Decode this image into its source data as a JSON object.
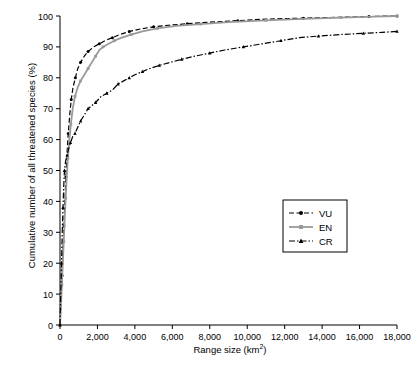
{
  "chart_data": {
    "type": "line",
    "title": "",
    "xlabel": "Range size (km2)",
    "ylabel": "Cumulative number of all threatened species (%)",
    "xlim": [
      0,
      18000
    ],
    "ylim": [
      0,
      100
    ],
    "grid": false,
    "legend_position": "bottom-right",
    "xticks": [
      0,
      2000,
      4000,
      6000,
      8000,
      10000,
      12000,
      14000,
      16000,
      18000
    ],
    "xticklabels": [
      "0",
      "2,000",
      "4,000",
      "6,000",
      "8,000",
      "10,000",
      "12,000",
      "14,000",
      "16,000",
      "18,000"
    ],
    "yticks": [
      0,
      10,
      20,
      30,
      40,
      50,
      60,
      70,
      80,
      90,
      100
    ],
    "yticklabels": [
      "0",
      "10",
      "20",
      "30",
      "40",
      "50",
      "60",
      "70",
      "80",
      "90",
      "100"
    ],
    "series": [
      {
        "name": "VU",
        "color": "#000000",
        "marker": "circle",
        "linestyle": "dashed",
        "points": [
          [
            0,
            0
          ],
          [
            60,
            8
          ],
          [
            110,
            16
          ],
          [
            160,
            24
          ],
          [
            210,
            32
          ],
          [
            260,
            40
          ],
          [
            320,
            48
          ],
          [
            380,
            56
          ],
          [
            440,
            62
          ],
          [
            520,
            68
          ],
          [
            600,
            73
          ],
          [
            700,
            77
          ],
          [
            820,
            80
          ],
          [
            950,
            83
          ],
          [
            1100,
            85
          ],
          [
            1300,
            87
          ],
          [
            1500,
            88.5
          ],
          [
            1800,
            90
          ],
          [
            2100,
            91
          ],
          [
            2400,
            92
          ],
          [
            2800,
            93
          ],
          [
            3200,
            94
          ],
          [
            3700,
            95
          ],
          [
            4300,
            95.8
          ],
          [
            5000,
            96.5
          ],
          [
            5800,
            97
          ],
          [
            6800,
            97.5
          ],
          [
            8000,
            98
          ],
          [
            9500,
            98.5
          ],
          [
            11000,
            99
          ],
          [
            13000,
            99.3
          ],
          [
            15000,
            99.6
          ],
          [
            16500,
            99.8
          ],
          [
            17500,
            100
          ],
          [
            18000,
            100
          ]
        ]
      },
      {
        "name": "EN",
        "color": "#999999",
        "marker": "square",
        "linestyle": "solid",
        "points": [
          [
            0,
            0
          ],
          [
            50,
            6
          ],
          [
            100,
            13
          ],
          [
            150,
            20
          ],
          [
            200,
            27
          ],
          [
            250,
            34
          ],
          [
            300,
            41
          ],
          [
            360,
            48
          ],
          [
            420,
            54
          ],
          [
            500,
            60
          ],
          [
            580,
            65
          ],
          [
            680,
            70
          ],
          [
            800,
            74
          ],
          [
            950,
            77
          ],
          [
            1100,
            79
          ],
          [
            1300,
            81
          ],
          [
            1500,
            83
          ],
          [
            1700,
            85
          ],
          [
            1900,
            87
          ],
          [
            2100,
            89
          ],
          [
            2300,
            90
          ],
          [
            2600,
            91
          ],
          [
            2900,
            92
          ],
          [
            3300,
            93
          ],
          [
            3800,
            94
          ],
          [
            4400,
            95
          ],
          [
            5200,
            96
          ],
          [
            6200,
            96.8
          ],
          [
            7500,
            97.4
          ],
          [
            9000,
            98
          ],
          [
            11000,
            98.6
          ],
          [
            13000,
            99.1
          ],
          [
            15000,
            99.5
          ],
          [
            16800,
            99.8
          ],
          [
            18000,
            100
          ]
        ]
      },
      {
        "name": "CR",
        "color": "#000000",
        "marker": "triangle",
        "linestyle": "dash-dot",
        "points": [
          [
            0,
            0
          ],
          [
            40,
            10
          ],
          [
            80,
            20
          ],
          [
            120,
            30
          ],
          [
            160,
            38
          ],
          [
            200,
            45
          ],
          [
            240,
            50
          ],
          [
            300,
            53
          ],
          [
            380,
            55
          ],
          [
            460,
            57
          ],
          [
            560,
            59
          ],
          [
            680,
            61
          ],
          [
            800,
            62
          ],
          [
            950,
            64
          ],
          [
            1100,
            66
          ],
          [
            1300,
            68
          ],
          [
            1500,
            70
          ],
          [
            1700,
            71
          ],
          [
            1900,
            72
          ],
          [
            2200,
            74
          ],
          [
            2500,
            75
          ],
          [
            2800,
            76
          ],
          [
            3100,
            78
          ],
          [
            3400,
            79
          ],
          [
            3700,
            80
          ],
          [
            4000,
            81
          ],
          [
            4400,
            82
          ],
          [
            4800,
            83
          ],
          [
            5300,
            84
          ],
          [
            5900,
            85
          ],
          [
            6500,
            86
          ],
          [
            7200,
            87
          ],
          [
            8000,
            88
          ],
          [
            8800,
            89
          ],
          [
            9800,
            90
          ],
          [
            10800,
            91
          ],
          [
            11800,
            92
          ],
          [
            12800,
            93
          ],
          [
            13800,
            93.5
          ],
          [
            15000,
            94
          ],
          [
            16200,
            94.4
          ],
          [
            17200,
            94.7
          ],
          [
            18000,
            95
          ]
        ]
      }
    ]
  },
  "legend": {
    "items": [
      {
        "label": "VU",
        "marker": "circle",
        "color": "#000000"
      },
      {
        "label": "EN",
        "marker": "square",
        "color": "#999999"
      },
      {
        "label": "CR",
        "marker": "triangle",
        "color": "#000000"
      }
    ]
  },
  "axes": {
    "y_title_main": "Cumulative number of all threatened species (%)",
    "x_title_main": "Range size (km",
    "x_title_sup": "2",
    "x_title_end": ")"
  }
}
